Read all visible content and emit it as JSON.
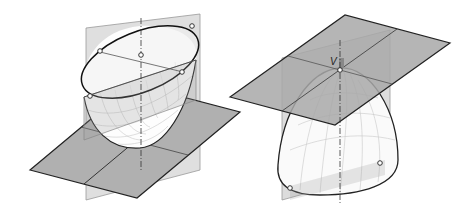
{
  "figure": {
    "left": {
      "description": "Elliptic paraboloid opening upward with horizontal base plane and two vertical plane cross-sections"
    },
    "right": {
      "description": "Elliptic paraboloid opening downward with tangent horizontal plane at vertex",
      "vertex_label": "V"
    }
  },
  "colors": {
    "plane": "#b4b4b4",
    "surface": "#ffffff",
    "edge": "#222222",
    "grid": "#bdbdbd"
  }
}
